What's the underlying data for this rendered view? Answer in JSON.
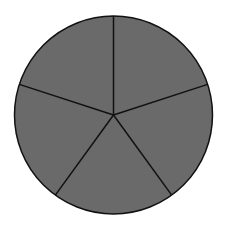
{
  "figure": {
    "shape": "circle",
    "sectors": 5,
    "fill_color": "#6a6a6a",
    "stroke_color": "#111111",
    "center": [
      113.5,
      115
    ],
    "radius": 99,
    "spoke_start_angle_deg": -90
  }
}
